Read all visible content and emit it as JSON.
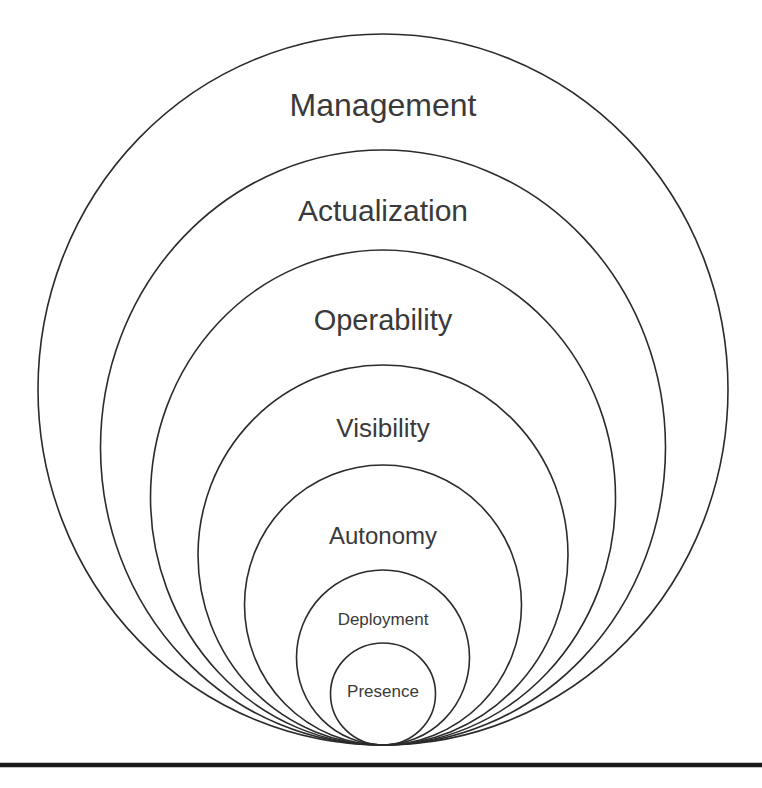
{
  "diagram": {
    "type": "nested-concentric-circles",
    "orientation": "bottom-tangent nested circles, largest outermost",
    "canvas": {
      "width": 762,
      "height": 788
    },
    "style": {
      "background_color": "#ffffff",
      "stroke_color": "#2b2b2b",
      "text_color": "#3a3a3a",
      "baseline_rule_color": "#1a1a1a",
      "stroke_width": 1.6
    },
    "tangent_point": {
      "x": 383,
      "y": 745
    },
    "center_x": 383,
    "layers": [
      {
        "label": "Management",
        "level": 7,
        "top_y": 34,
        "width": 690,
        "height": 711,
        "label_y": 116,
        "font_size": 32
      },
      {
        "label": "Actualization",
        "level": 6,
        "top_y": 150,
        "width": 565,
        "height": 595,
        "label_y": 221,
        "font_size": 30
      },
      {
        "label": "Operability",
        "level": 5,
        "top_y": 250,
        "width": 465,
        "height": 495,
        "label_y": 330,
        "font_size": 29
      },
      {
        "label": "Visibility",
        "level": 4,
        "top_y": 365,
        "width": 370,
        "height": 380,
        "label_y": 437,
        "font_size": 26
      },
      {
        "label": "Autonomy",
        "level": 3,
        "top_y": 465,
        "width": 277,
        "height": 280,
        "label_y": 544,
        "font_size": 24
      },
      {
        "label": "Deployment",
        "level": 2,
        "top_y": 570,
        "width": 173,
        "height": 175,
        "label_y": 625,
        "font_size": 17
      },
      {
        "label": "Presence",
        "level": 1,
        "top_y": 643,
        "width": 105,
        "height": 102,
        "label_y": 697,
        "font_size": 17
      }
    ],
    "baseline_rule": {
      "x1": 0,
      "x2": 762,
      "y": 765,
      "thickness": 4.5
    }
  }
}
